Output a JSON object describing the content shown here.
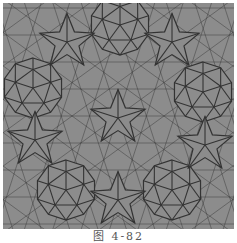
{
  "figure": {
    "caption": "图 4-82",
    "colors": {
      "fill": "#8c8c8c",
      "line": "#333333",
      "background": "#ffffff"
    },
    "wheels": [
      {
        "cx": 30,
        "cy": 85
      },
      {
        "cx": 117,
        "cy": 22
      },
      {
        "cx": 200,
        "cy": 89
      },
      {
        "cx": 63,
        "cy": 187
      },
      {
        "cx": 169,
        "cy": 187
      }
    ],
    "stars": [
      {
        "cx": 64,
        "cy": 39
      },
      {
        "cx": 169,
        "cy": 39
      },
      {
        "cx": 115,
        "cy": 115
      },
      {
        "cx": 32,
        "cy": 137
      },
      {
        "cx": 202,
        "cy": 142
      },
      {
        "cx": 115,
        "cy": 197
      }
    ],
    "radius": 30
  }
}
